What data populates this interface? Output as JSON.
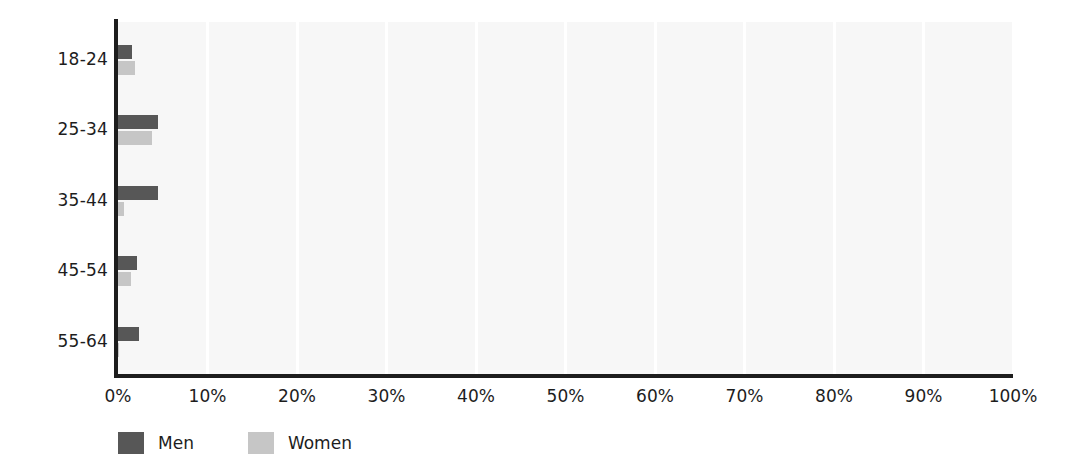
{
  "chart_data": {
    "type": "bar",
    "orientation": "horizontal",
    "title": "",
    "xlabel": "",
    "ylabel": "",
    "categories": [
      "18-24",
      "25-34",
      "35-44",
      "45-54",
      "55-64"
    ],
    "series": [
      {
        "name": "Men",
        "color": "#575757",
        "values": [
          1.6,
          4.5,
          4.5,
          2.1,
          2.4
        ]
      },
      {
        "name": "Women",
        "color": "#c6c6c6",
        "values": [
          1.9,
          3.8,
          0.7,
          1.4,
          0.1
        ]
      }
    ],
    "xlim": [
      0,
      100
    ],
    "xticks": [
      0,
      10,
      20,
      30,
      40,
      50,
      60,
      70,
      80,
      90,
      100
    ],
    "xticklabels": [
      "0%",
      "10%",
      "20%",
      "30%",
      "40%",
      "50%",
      "60%",
      "70%",
      "80%",
      "90%",
      "100%"
    ],
    "grid": "vertical",
    "grid_color": "#ffffff",
    "plot_background": "#f7f7f7",
    "axis_color": "#1d1d1d",
    "legend_position": "bottom-left",
    "legend_entries": [
      "Men",
      "Women"
    ]
  }
}
